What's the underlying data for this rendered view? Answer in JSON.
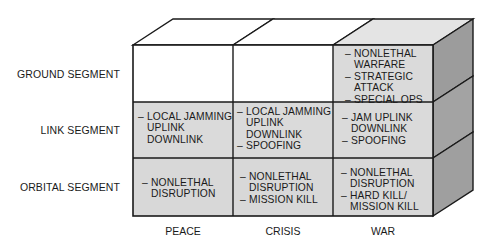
{
  "diagram": {
    "colors": {
      "shaded_face": "#d9d9d9",
      "white_face": "#ffffff",
      "top_shaded": "#e4e4e4",
      "side_face": "#9c9c9c",
      "line": "#1a1a1a"
    },
    "rows": [
      {
        "label": "GROUND SEGMENT"
      },
      {
        "label": "LINK SEGMENT"
      },
      {
        "label": "ORBITAL SEGMENT"
      }
    ],
    "columns": [
      {
        "label": "PEACE"
      },
      {
        "label": "CRISIS"
      },
      {
        "label": "WAR"
      }
    ],
    "cells": {
      "ground_peace": {
        "lines": []
      },
      "ground_crisis": {
        "lines": []
      },
      "ground_war": {
        "lines": [
          {
            "bullet": true,
            "text": "NONLETHAL"
          },
          {
            "bullet": false,
            "text": "WARFARE"
          },
          {
            "bullet": true,
            "text": "STRATEGIC"
          },
          {
            "bullet": false,
            "text": "ATTACK"
          },
          {
            "bullet": true,
            "text": "SPECIAL OPS"
          }
        ]
      },
      "link_peace": {
        "lines": [
          {
            "bullet": true,
            "text": "LOCAL JAMMING"
          },
          {
            "bullet": false,
            "text": "UPLINK"
          },
          {
            "bullet": false,
            "text": "DOWNLINK"
          }
        ]
      },
      "link_crisis": {
        "lines": [
          {
            "bullet": true,
            "text": "LOCAL JAMMING"
          },
          {
            "bullet": false,
            "text": "UPLINK"
          },
          {
            "bullet": false,
            "text": "DOWNLINK"
          },
          {
            "bullet": true,
            "text": "SPOOFING"
          }
        ]
      },
      "link_war": {
        "lines": [
          {
            "bullet": true,
            "text": "JAM UPLINK"
          },
          {
            "bullet": false,
            "text": "DOWNLINK"
          },
          {
            "bullet": true,
            "text": "SPOOFING"
          }
        ]
      },
      "orbital_peace": {
        "lines": [
          {
            "bullet": true,
            "text": "NONLETHAL"
          },
          {
            "bullet": false,
            "text": "DISRUPTION"
          }
        ]
      },
      "orbital_crisis": {
        "lines": [
          {
            "bullet": true,
            "text": "NONLETHAL"
          },
          {
            "bullet": false,
            "text": "DISRUPTION"
          },
          {
            "bullet": true,
            "text": "MISSION KILL"
          }
        ]
      },
      "orbital_war": {
        "lines": [
          {
            "bullet": true,
            "text": "NONLETHAL"
          },
          {
            "bullet": false,
            "text": "DISRUPTION"
          },
          {
            "bullet": true,
            "text": "HARD KILL/"
          },
          {
            "bullet": false,
            "text": "MISSION KILL"
          }
        ]
      }
    },
    "dash_glyph": "–"
  }
}
